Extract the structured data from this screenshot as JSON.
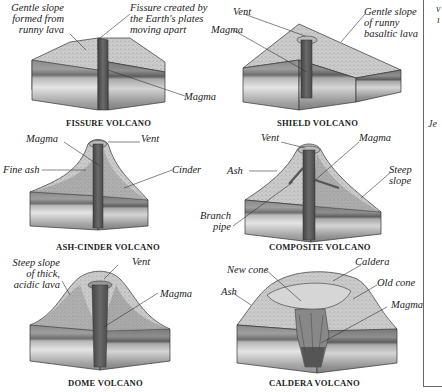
{
  "figure": {
    "colors": {
      "surface": "#cfcfcf",
      "surface_dark": "#a9a9a9",
      "strata_top": "#8d8d8d",
      "strata_mid": "#bdbdbd",
      "strata_light": "#e2e2e2",
      "strata_low": "#9a9a9a",
      "magma": "#555555",
      "line": "#333333"
    }
  },
  "panels": [
    {
      "id": "fissure",
      "caption": "FISSURE VOLCANO",
      "labels": [
        "Gentle slope",
        "formed from",
        "runny lava",
        "Fissure created by",
        "the Earth's plates",
        "moving apart",
        "Magma"
      ]
    },
    {
      "id": "shield",
      "caption": "SHIELD VOLCANO",
      "labels": [
        "Vent",
        "Gentle slope",
        "of runny",
        "basaltic lava",
        "Magma"
      ]
    },
    {
      "id": "ash_cinder",
      "caption": "ASH-CINDER VOLCANO",
      "labels": [
        "Magma",
        "Vent",
        "Fine ash",
        "Cinder"
      ]
    },
    {
      "id": "composite",
      "caption": "COMPOSITE VOLCANO",
      "labels": [
        "Vent",
        "Magma",
        "Ash",
        "Steep",
        "slope",
        "Branch",
        "pipe"
      ]
    },
    {
      "id": "dome",
      "caption": "DOME VOLCANO",
      "labels": [
        "Steep slope",
        "of thick,",
        "acidic lava",
        "Vent",
        "Magma"
      ]
    },
    {
      "id": "caldera",
      "caption": "CALDERA VOLCANO",
      "labels": [
        "New cone",
        "Caldera",
        "Old cone",
        "Ash",
        "Magma"
      ]
    }
  ],
  "edge_fragments": {
    "top": "v",
    "top2": "ı",
    "mid": "Je"
  }
}
